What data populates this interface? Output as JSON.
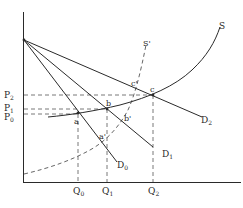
{
  "diagram": {
    "type": "supply-demand",
    "axes": {
      "x_label": "",
      "y_label": ""
    },
    "supply_curves": [
      {
        "id": "S",
        "label": "S",
        "style": "solid"
      },
      {
        "id": "S_prime",
        "label": "S'",
        "style": "dashed"
      }
    ],
    "demand_curves": [
      {
        "id": "D0",
        "label": "D",
        "sub": "0"
      },
      {
        "id": "D1",
        "label": "D",
        "sub": "1"
      },
      {
        "id": "D2",
        "label": "D",
        "sub": "2"
      }
    ],
    "price_labels": [
      {
        "label": "P",
        "sub": "2"
      },
      {
        "label": "P",
        "sub": "1"
      },
      {
        "label": "P",
        "sub": "0"
      }
    ],
    "quantity_labels": [
      {
        "label": "Q",
        "sub": "0"
      },
      {
        "label": "Q",
        "sub": "1"
      },
      {
        "label": "Q",
        "sub": "2"
      }
    ],
    "points": [
      {
        "label": "a"
      },
      {
        "label": "b"
      },
      {
        "label": "c"
      },
      {
        "label": "a'"
      },
      {
        "label": "b'"
      },
      {
        "label": "c'"
      }
    ],
    "colors": {
      "line": "#2a2a2a",
      "dashed": "#555555",
      "background": "#ffffff"
    }
  }
}
